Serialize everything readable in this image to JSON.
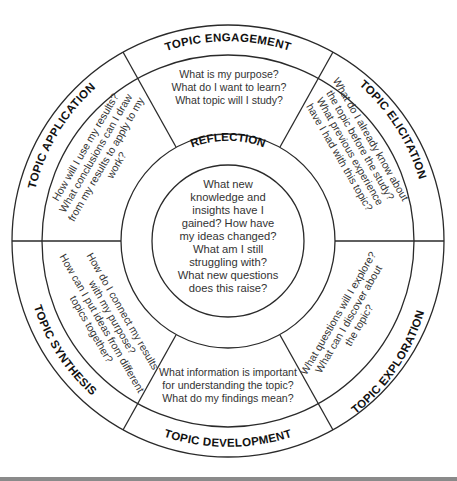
{
  "diagram": {
    "center": {
      "label": "REFLECTION",
      "lines": [
        "What new",
        "knowledge and",
        "insights have I",
        "gained? How have",
        "my ideas changed?",
        "What am I still",
        "struggling with?",
        "What new questions",
        "does this raise?"
      ]
    },
    "segments": [
      {
        "label": "TOPIC ENGAGEMENT",
        "position": "top",
        "lines": [
          "What is my purpose?",
          "What do I want to learn?",
          "What topic will I study?"
        ]
      },
      {
        "label": "TOPIC ELICITATION",
        "position": "upper-right",
        "lines": [
          "What do I already know about",
          "the topic before the study?",
          "What previous experience",
          "have I had with this topic?"
        ]
      },
      {
        "label": "TOPIC EXPLORATION",
        "position": "lower-right",
        "lines": [
          "What questions will I explore?",
          "What can I discover about",
          "the topic?"
        ]
      },
      {
        "label": "TOPIC DEVELOPMENT",
        "position": "bottom",
        "lines": [
          "What information is important",
          "for understanding the topic?",
          "What do my findings mean?"
        ]
      },
      {
        "label": "TOPIC SYNTHESIS",
        "position": "lower-left",
        "lines": [
          "How do I connect my results",
          "with my purpose?",
          "How can I put ideas from different",
          "topics together?"
        ]
      },
      {
        "label": "TOPIC APPLICATION",
        "position": "upper-left",
        "lines": [
          "How will I use my results?",
          "What conclusions can I draw",
          "from my results to apply to my",
          "work?"
        ]
      }
    ],
    "colors": {
      "stroke": "#2a2a2a",
      "label": "#111111",
      "text": "#333333",
      "background": "#ffffff",
      "footer_bar": "#8a8a8a"
    }
  }
}
